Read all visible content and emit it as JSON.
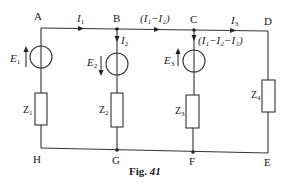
{
  "figure": {
    "caption": "Fig. 41",
    "caption_prefix": "Fig.",
    "caption_number": "41"
  },
  "nodes": {
    "A": "A",
    "B": "B",
    "C": "C",
    "D": "D",
    "E": "E",
    "F": "F",
    "G": "G",
    "H": "H"
  },
  "currents": {
    "I1": "I",
    "I1_sub": "1",
    "I2": "I",
    "I2_sub": "2",
    "I3": "I",
    "I3_sub": "3",
    "branch_BC": "(I₁−I₂)",
    "branch_C_down": "(I₁−I₂−I₃)"
  },
  "sources": [
    {
      "name": "E",
      "sub": "1",
      "direction": "up"
    },
    {
      "name": "E",
      "sub": "2",
      "direction": "down"
    },
    {
      "name": "E",
      "sub": "3",
      "direction": "up"
    }
  ],
  "impedances": [
    {
      "name": "Z",
      "sub": "1"
    },
    {
      "name": "Z",
      "sub": "2"
    },
    {
      "name": "Z",
      "sub": "3"
    },
    {
      "name": "Z",
      "sub": "4"
    }
  ],
  "colors": {
    "wire": "#333333",
    "text": "#222222",
    "background": "#ffffff"
  }
}
